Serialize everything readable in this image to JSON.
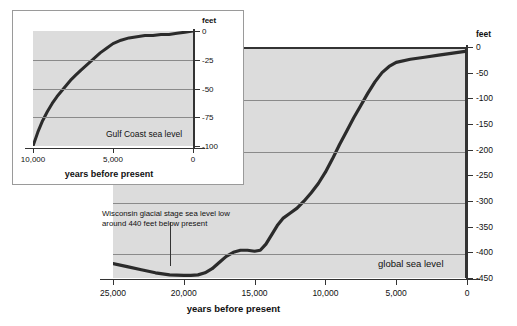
{
  "chart_data": [
    {
      "id": "global",
      "type": "line",
      "title": "",
      "series_label": "global sea level",
      "xlabel": "years before present",
      "ylabel": "feet",
      "xlim": [
        25000,
        0
      ],
      "ylim": [
        -450,
        0
      ],
      "xticks": [
        25000,
        20000,
        15000,
        10000,
        5000,
        0
      ],
      "xticklabels": [
        "25,000",
        "20,000",
        "15,000",
        "10,000",
        "5,000",
        "0"
      ],
      "yticks": [
        0,
        -50,
        -100,
        -150,
        -200,
        -250,
        -300,
        -350,
        -400,
        -450
      ],
      "yticklabels": [
        "0",
        "-50",
        "-100",
        "-150",
        "-200",
        "-250",
        "-300",
        "-350",
        "-400",
        "-450"
      ],
      "gridlines_y": [
        -100,
        -200,
        -300,
        -400
      ],
      "grid": true,
      "legend": "none",
      "annotations": [
        {
          "text": "Wisconsin glacial stage sea level low around 440 feet below present",
          "points_to_x": 19000,
          "points_to_y": -440
        }
      ],
      "x": [
        25000,
        24000,
        23000,
        22000,
        21000,
        20000,
        19500,
        19000,
        18500,
        18000,
        17500,
        17000,
        16500,
        16000,
        15500,
        15000,
        14600,
        14200,
        13800,
        13400,
        13000,
        12500,
        12000,
        11500,
        11000,
        10500,
        10000,
        9500,
        9000,
        8500,
        8000,
        7500,
        7000,
        6500,
        6000,
        5500,
        5000,
        4000,
        3000,
        2000,
        1000,
        0
      ],
      "y": [
        -418,
        -424,
        -430,
        -436,
        -440,
        -441,
        -441,
        -440,
        -436,
        -428,
        -416,
        -404,
        -396,
        -392,
        -392,
        -394,
        -392,
        -380,
        -362,
        -344,
        -330,
        -320,
        -310,
        -296,
        -280,
        -262,
        -240,
        -214,
        -186,
        -160,
        -134,
        -110,
        -86,
        -64,
        -46,
        -34,
        -26,
        -20,
        -16,
        -12,
        -8,
        -4
      ]
    },
    {
      "id": "gulf-coast",
      "type": "line",
      "title": "",
      "series_label": "Gulf Coast sea level",
      "xlabel": "years before present",
      "ylabel": "feet",
      "xlim": [
        10000,
        0
      ],
      "ylim": [
        -100,
        0
      ],
      "xticks": [
        10000,
        5000,
        0
      ],
      "xticklabels": [
        "10,000",
        "5,000",
        "0"
      ],
      "yticks": [
        0,
        -25,
        -50,
        -75,
        -100
      ],
      "yticklabels": [
        "0",
        "-25",
        "-50",
        "-75",
        "-100"
      ],
      "gridlines_y": [
        -25,
        -50,
        -75
      ],
      "grid": true,
      "legend": "none",
      "x": [
        10000,
        9700,
        9400,
        9100,
        8800,
        8500,
        8200,
        7900,
        7600,
        7300,
        7000,
        6600,
        6200,
        5800,
        5400,
        5000,
        4500,
        4000,
        3500,
        3000,
        2500,
        2000,
        1500,
        1000,
        500,
        0
      ],
      "y": [
        -100,
        -88,
        -78,
        -70,
        -63,
        -57,
        -52,
        -47,
        -42,
        -38,
        -34,
        -29,
        -24,
        -19,
        -15,
        -11,
        -8,
        -6,
        -5,
        -4,
        -4,
        -3,
        -3,
        -2,
        -1,
        0
      ]
    }
  ],
  "main": {
    "unit_label": "feet",
    "xtitle": "years before present",
    "series_label": "global sea level",
    "annotation_line1": "Wisconsin glacial stage sea level low",
    "annotation_line2": "around 440 feet below present"
  },
  "inset": {
    "unit_label": "feet",
    "xtitle": "years before present",
    "series_label": "Gulf Coast sea level"
  },
  "colors": {
    "plot_background": "#dcdcdc",
    "curve": "#2b2b2b",
    "gridline": "#8a8a8a",
    "axis": "#333333",
    "page_background": "#ffffff"
  }
}
